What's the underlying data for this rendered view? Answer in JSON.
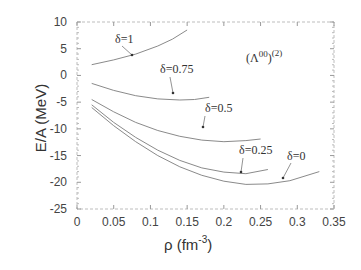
{
  "chart_data": {
    "type": "line",
    "title": "",
    "xlabel": "ρ (fm^-3)",
    "ylabel": "E/A (MeV)",
    "xlim": [
      0,
      0.35
    ],
    "ylim": [
      -25,
      10
    ],
    "xticks": [
      0,
      0.05,
      0.1,
      0.15,
      0.2,
      0.25,
      0.3,
      0.35
    ],
    "xtick_labels": [
      "0",
      "0.05",
      "0.1",
      "0.15",
      "0.2",
      "0.25",
      "0.3",
      "0.35"
    ],
    "yticks": [
      10,
      5,
      0,
      -5,
      -10,
      -15,
      -20,
      -25
    ],
    "ytick_labels": [
      "10",
      "5",
      "0",
      "-5",
      "-10",
      "-15",
      "-20",
      "-25"
    ],
    "grid": false,
    "legend": "none (curves labeled inline with arrows)",
    "annotation": "(Λ00)(2)",
    "series": [
      {
        "name": "δ=1",
        "x": [
          0.02,
          0.05,
          0.08,
          0.11,
          0.13,
          0.15
        ],
        "y": [
          2.0,
          2.9,
          4.0,
          5.5,
          6.8,
          8.5
        ]
      },
      {
        "name": "δ=0.75",
        "x": [
          0.02,
          0.05,
          0.08,
          0.11,
          0.14,
          0.16,
          0.18
        ],
        "y": [
          -1.5,
          -2.8,
          -3.8,
          -4.4,
          -4.6,
          -4.5,
          -4.1
        ]
      },
      {
        "name": "δ=0.5",
        "x": [
          0.02,
          0.05,
          0.08,
          0.11,
          0.14,
          0.17,
          0.2,
          0.23,
          0.25
        ],
        "y": [
          -4.5,
          -6.8,
          -8.8,
          -10.3,
          -11.4,
          -12.1,
          -12.4,
          -12.2,
          -11.9
        ]
      },
      {
        "name": "δ=0.25",
        "x": [
          0.02,
          0.05,
          0.08,
          0.11,
          0.14,
          0.17,
          0.2,
          0.23,
          0.26
        ],
        "y": [
          -5.5,
          -8.8,
          -11.6,
          -14.0,
          -15.9,
          -17.3,
          -18.1,
          -18.4,
          -17.6
        ]
      },
      {
        "name": "δ=0",
        "x": [
          0.02,
          0.05,
          0.08,
          0.11,
          0.14,
          0.17,
          0.2,
          0.23,
          0.26,
          0.29,
          0.33
        ],
        "y": [
          -6.0,
          -9.4,
          -12.4,
          -15.0,
          -17.1,
          -18.7,
          -19.8,
          -20.4,
          -20.3,
          -19.7,
          -18.0
        ]
      }
    ]
  },
  "labels": {
    "xlabel_main": "ρ (fm",
    "xlabel_sup": "-3",
    "xlabel_close": ")",
    "ylabel": "E/A (MeV)",
    "annotation_main": "(Λ",
    "annotation_sup1": "00",
    "annotation_close": ")",
    "annotation_sup2": "(2)",
    "curve_labels": [
      "δ=1",
      "δ=0.75",
      "δ=0.5",
      "δ=0.25",
      "δ=0"
    ]
  }
}
